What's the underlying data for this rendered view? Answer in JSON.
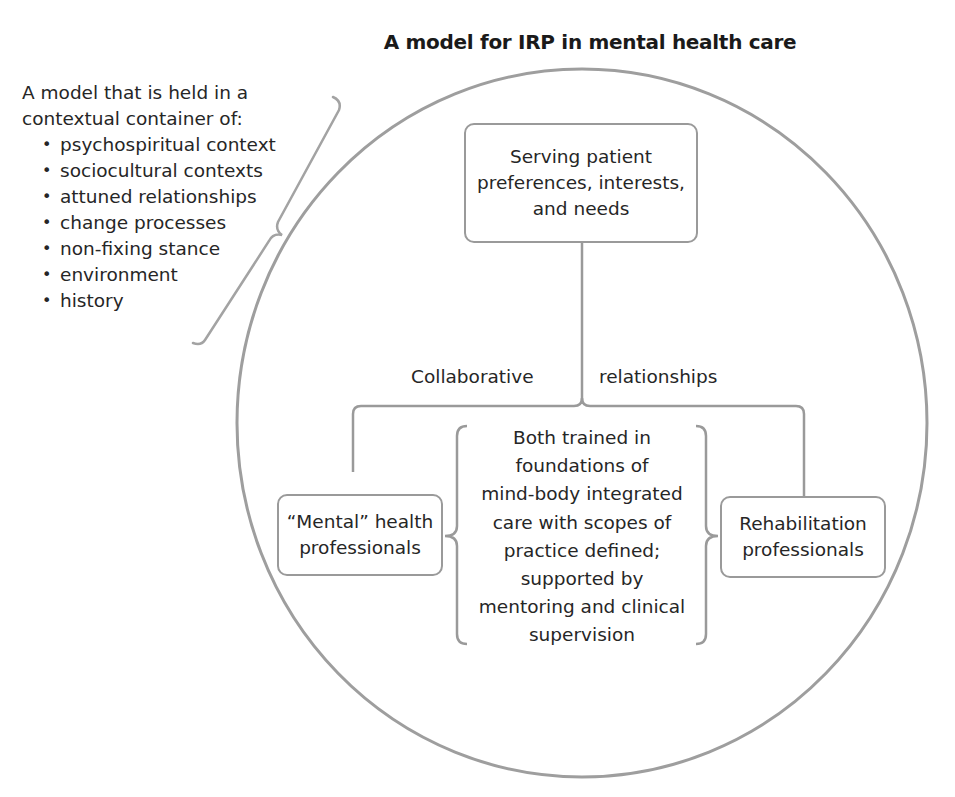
{
  "title": "A model for IRP in mental health care",
  "context_container": {
    "intro_line1": "A model that is held in a",
    "intro_line2": "contextual container of:",
    "items": [
      "psychospiritual context",
      "sociocultural contexts",
      "attuned relationships",
      "change processes",
      "non-fixing stance",
      "environment",
      "history"
    ]
  },
  "top_node": {
    "lines": [
      "Serving patient",
      "preferences, interests,",
      "and needs"
    ]
  },
  "connector_label": {
    "left": "Collaborative",
    "right": "relationships"
  },
  "left_node": {
    "lines": [
      "“Mental” health",
      "professionals"
    ]
  },
  "right_node": {
    "lines": [
      "Rehabilitation",
      "professionals"
    ]
  },
  "shared_training": {
    "lines": [
      "Both trained in",
      "foundations of",
      "mind-body integrated",
      "care with scopes of",
      "practice defined;",
      "supported by",
      "mentoring and clinical",
      "supervision"
    ]
  },
  "colors": {
    "stroke": "#9a9a9a",
    "text": "#262626",
    "background": "#ffffff"
  }
}
